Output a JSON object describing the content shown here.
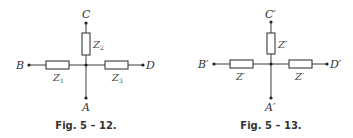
{
  "figures": [
    {
      "caption": "Fig. 5 – 12.",
      "nodes": {
        "top": "C",
        "left": "B",
        "right": "D",
        "bottom": "A"
      },
      "impedances": {
        "vertical": {
          "base": "Z",
          "sub": "2"
        },
        "left": {
          "base": "Z",
          "sub": "1"
        },
        "right": {
          "base": "Z",
          "sub": "3"
        }
      }
    },
    {
      "caption": "Fig. 5 – 13.",
      "nodes": {
        "top": "C′",
        "left": "B′",
        "right": "D′",
        "bottom": "A′"
      },
      "impedances": {
        "vertical": {
          "base": "Z′",
          "sub": ""
        },
        "left": {
          "base": "Z′",
          "sub": ""
        },
        "right": {
          "base": "Z′",
          "sub": ""
        }
      }
    }
  ],
  "colors": {
    "line": "#3a3a3a",
    "text": "#333333",
    "background": "#ffffff"
  }
}
